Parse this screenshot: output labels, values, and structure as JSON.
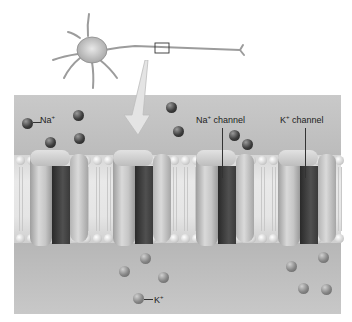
{
  "diagram": {
    "labels": {
      "na_ion": {
        "text": "Na",
        "charge": "+"
      },
      "na_channel": {
        "text": "Na",
        "charge": "+",
        "suffix": " channel"
      },
      "k_channel": {
        "text": "K",
        "charge": "+",
        "suffix": " channel"
      },
      "k_ion": {
        "text": "K",
        "charge": "+"
      }
    },
    "colors": {
      "panel_bg": "#bdbdbd",
      "membrane": "#e5e5e5",
      "channel_body": "#c6c6c6",
      "channel_pore": "#3a3a3a",
      "na_ion": "#2e2e2e",
      "k_ion": "#858585"
    },
    "na_ions": [
      {
        "x": 22,
        "y": 118
      },
      {
        "x": 73,
        "y": 110
      },
      {
        "x": 45,
        "y": 137
      },
      {
        "x": 74,
        "y": 133
      },
      {
        "x": 166,
        "y": 102
      },
      {
        "x": 173,
        "y": 126
      },
      {
        "x": 229,
        "y": 130
      },
      {
        "x": 242,
        "y": 139
      }
    ],
    "k_ions": [
      {
        "x": 140,
        "y": 253
      },
      {
        "x": 119,
        "y": 266
      },
      {
        "x": 158,
        "y": 272
      },
      {
        "x": 133,
        "y": 293
      },
      {
        "x": 286,
        "y": 261
      },
      {
        "x": 318,
        "y": 252
      },
      {
        "x": 298,
        "y": 283
      },
      {
        "x": 321,
        "y": 284
      }
    ],
    "channels": [
      {
        "name": "na-channel-1",
        "x": 30
      },
      {
        "name": "na-channel-2",
        "x": 113
      },
      {
        "name": "na-channel-3",
        "x": 196
      },
      {
        "name": "k-channel",
        "x": 278
      }
    ]
  }
}
